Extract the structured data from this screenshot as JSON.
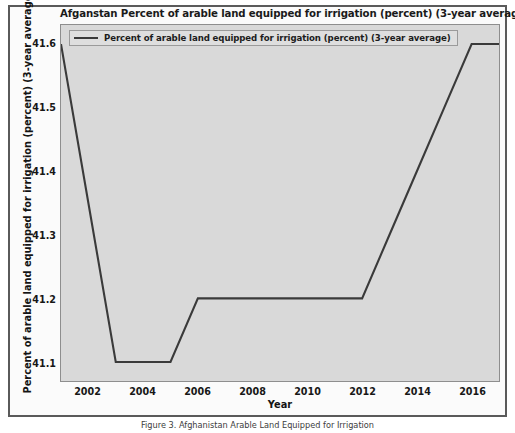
{
  "figure": {
    "title": "Afganstan Percent of arable land equipped for irrigation (percent) (3-year average)",
    "caption": "Figure 3. Afghanistan Arable Land Equipped for Irrigation"
  },
  "axes": {
    "xlabel": "Year",
    "ylabel": "Percent of arable land equipped for irrigation (percent) (3-year average)",
    "xticks": [
      "2002",
      "2004",
      "2006",
      "2008",
      "2010",
      "2012",
      "2014",
      "2016"
    ],
    "yticks": [
      "41.1",
      "41.2",
      "41.3",
      "41.4",
      "41.5",
      "41.6"
    ]
  },
  "legend": {
    "entries": [
      {
        "label": "Percent of arable land equipped for irrigation (percent) (3-year average)",
        "color": "#3a3a3a"
      }
    ]
  },
  "colors": {
    "line": "#3a3a3a",
    "plot_background": "#d9d9d9",
    "figure_background": "#fbfbfb",
    "frame": "#5a5a5a"
  },
  "chart_data": {
    "type": "line",
    "title": "Afganstan Percent of arable land equipped for irrigation (percent) (3-year average)",
    "xlabel": "Year",
    "ylabel": "Percent of arable land equipped for irrigation (percent) (3-year average)",
    "xlim": [
      2001,
      2017
    ],
    "ylim": [
      41.07,
      41.63
    ],
    "grid": false,
    "legend_position": "upper left",
    "series": [
      {
        "name": "Percent of arable land equipped for irrigation (percent) (3-year average)",
        "color": "#3a3a3a",
        "x": [
          2001,
          2002,
          2003,
          2004,
          2005,
          2006,
          2007,
          2008,
          2009,
          2010,
          2011,
          2012,
          2013,
          2014,
          2015,
          2016,
          2017
        ],
        "values": [
          41.6,
          41.35,
          41.1,
          41.1,
          41.1,
          41.2,
          41.2,
          41.2,
          41.2,
          41.2,
          41.2,
          41.2,
          41.3,
          41.4,
          41.5,
          41.6,
          41.6
        ]
      }
    ]
  }
}
